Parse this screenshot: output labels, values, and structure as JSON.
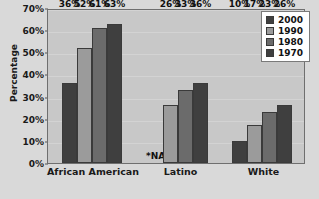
{
  "chart_data": {
    "type": "bar",
    "title": "",
    "xlabel": "",
    "ylabel": "Percentage",
    "ylim": [
      0,
      70
    ],
    "ytick_labels": [
      "0%",
      "10%",
      "20%",
      "30%",
      "40%",
      "50%",
      "60%",
      "70%"
    ],
    "ytick_values": [
      0,
      10,
      20,
      30,
      40,
      50,
      60,
      70
    ],
    "grid": true,
    "legend_position": "top-right",
    "categories": [
      "African American",
      "Latino",
      "White"
    ],
    "series": [
      {
        "name": "2000",
        "color": "#3f3f3f",
        "values": [
          36,
          null,
          10
        ],
        "labels": [
          "36%",
          "*NA",
          "10%"
        ]
      },
      {
        "name": "1990",
        "color": "#9b9b9b",
        "values": [
          52,
          26,
          17
        ],
        "labels": [
          "52%",
          "26%",
          "17%"
        ]
      },
      {
        "name": "1980",
        "color": "#6b6b6b",
        "values": [
          61,
          33,
          23
        ],
        "labels": [
          "61%",
          "33%",
          "23%"
        ]
      },
      {
        "name": "1970",
        "color": "#3f3f3f",
        "values": [
          63,
          36,
          26
        ],
        "labels": [
          "63%",
          "36%",
          "26%"
        ]
      }
    ],
    "missing_data_note": "*NA",
    "plot_background": "#c8c8c8",
    "figure_background": "#d9d9d9"
  }
}
